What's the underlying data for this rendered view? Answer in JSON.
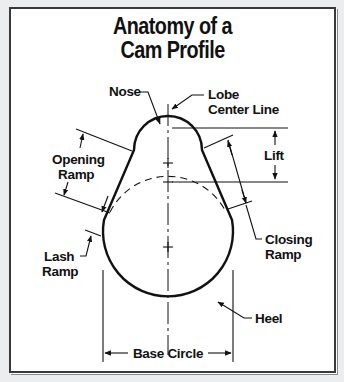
{
  "title": {
    "line1": "Anatomy of a",
    "line2": "Cam Profile"
  },
  "labels": {
    "nose": "Nose",
    "lobe_center_line_1": "Lobe",
    "lobe_center_line_2": "Center Line",
    "opening_ramp_1": "Opening",
    "opening_ramp_2": "Ramp",
    "lift": "Lift",
    "closing_ramp_1": "Closing",
    "closing_ramp_2": "Ramp",
    "lash_ramp_1": "Lash",
    "lash_ramp_2": "Ramp",
    "heel": "Heel",
    "base_circle": "Base Circle"
  },
  "colors": {
    "background": "#ecedee",
    "panel": "#ffffff",
    "ink": "#111111"
  }
}
